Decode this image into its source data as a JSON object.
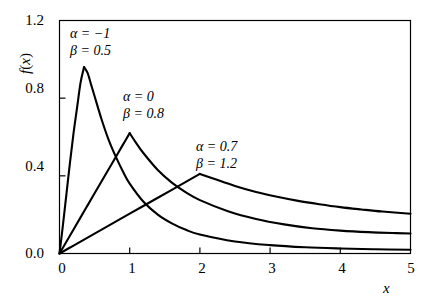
{
  "chart_data": {
    "type": "line",
    "title": "",
    "subtitle": "",
    "xlabel": "x",
    "ylabel": "f(x)",
    "xlim": [
      0,
      5
    ],
    "ylim": [
      0,
      1.2
    ],
    "xticks": [
      "0",
      "1",
      "2",
      "3",
      "4",
      "5"
    ],
    "xtick_values": [
      0,
      1,
      2,
      3,
      4,
      5
    ],
    "yticks": [
      "0.0",
      "0.4",
      "0.8",
      "1.2"
    ],
    "ytick_values": [
      0.0,
      0.4,
      0.8,
      1.2
    ],
    "grid": false,
    "legend": "inline-annotations",
    "line_color": "#000000",
    "frame_color": "#000000",
    "background": "#ffffff",
    "series": [
      {
        "name": "alpha=-1, beta=0.5",
        "alpha": -1,
        "beta": 0.5,
        "peak_x": 0.35,
        "peak_y": 0.96,
        "x": [
          0.0,
          0.05,
          0.1,
          0.15,
          0.2,
          0.25,
          0.3,
          0.35,
          0.4,
          0.45,
          0.5,
          0.6,
          0.7,
          0.8,
          0.9,
          1.0,
          1.2,
          1.4,
          1.6,
          1.8,
          2.0,
          2.5,
          3.0,
          3.5,
          4.0,
          4.5,
          5.0
        ],
        "y": [
          0.0,
          0.15,
          0.31,
          0.47,
          0.62,
          0.75,
          0.88,
          0.96,
          0.93,
          0.87,
          0.81,
          0.69,
          0.585,
          0.5,
          0.425,
          0.36,
          0.265,
          0.2,
          0.155,
          0.122,
          0.098,
          0.062,
          0.043,
          0.032,
          0.026,
          0.022,
          0.019
        ]
      },
      {
        "name": "alpha=0, beta=0.8",
        "alpha": 0,
        "beta": 0.8,
        "peak_x": 1.0,
        "peak_y": 0.62,
        "x": [
          0.0,
          0.1,
          0.2,
          0.3,
          0.4,
          0.5,
          0.6,
          0.7,
          0.8,
          0.9,
          1.0,
          1.1,
          1.2,
          1.4,
          1.6,
          1.8,
          2.0,
          2.4,
          2.8,
          3.2,
          3.6,
          4.0,
          4.4,
          4.8,
          5.0
        ],
        "y": [
          0.0,
          0.062,
          0.124,
          0.186,
          0.248,
          0.31,
          0.372,
          0.434,
          0.496,
          0.558,
          0.62,
          0.565,
          0.515,
          0.43,
          0.365,
          0.315,
          0.275,
          0.218,
          0.178,
          0.15,
          0.13,
          0.118,
          0.11,
          0.105,
          0.103
        ]
      },
      {
        "name": "alpha=0.7, beta=1.2",
        "alpha": 0.7,
        "beta": 1.2,
        "peak_x": 2.0,
        "peak_y": 0.41,
        "x": [
          0.0,
          0.2,
          0.4,
          0.6,
          0.8,
          1.0,
          1.2,
          1.4,
          1.6,
          1.8,
          2.0,
          2.2,
          2.5,
          2.8,
          3.1,
          3.4,
          3.7,
          4.0,
          4.3,
          4.6,
          5.0
        ],
        "y": [
          0.0,
          0.041,
          0.082,
          0.123,
          0.164,
          0.205,
          0.246,
          0.287,
          0.328,
          0.369,
          0.41,
          0.385,
          0.348,
          0.317,
          0.292,
          0.271,
          0.254,
          0.239,
          0.227,
          0.216,
          0.205
        ]
      }
    ],
    "annotations": [
      {
        "id": "annotation-curve-1",
        "line1": "α = −1",
        "line2": "β = 0.5",
        "x_px": 70,
        "y_px": 25
      },
      {
        "id": "annotation-curve-2",
        "line1": "α = 0",
        "line2": "β = 0.8",
        "x_px": 123,
        "y_px": 88
      },
      {
        "id": "annotation-curve-3",
        "line1": "α = 0.7",
        "line2": "β = 1.2",
        "x_px": 196,
        "y_px": 138
      }
    ]
  },
  "axes": {
    "y_label_fn": "f",
    "y_label_open": "(",
    "y_label_var": "x",
    "y_label_close": ")",
    "x_label": "x"
  },
  "ticks": {
    "y": [
      {
        "label": "1.2",
        "top": 13
      },
      {
        "label": "0.8",
        "top": 81
      },
      {
        "label": "0.4",
        "top": 159
      },
      {
        "label": "0.0",
        "top": 246
      }
    ],
    "x": [
      {
        "label": "0",
        "left": 47
      },
      {
        "label": "1",
        "left": 117
      },
      {
        "label": "2",
        "left": 187
      },
      {
        "label": "3",
        "left": 257
      },
      {
        "label": "4",
        "left": 327
      },
      {
        "label": "5",
        "left": 396
      }
    ]
  }
}
